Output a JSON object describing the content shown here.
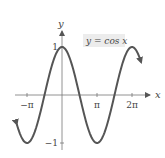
{
  "chart_data": {
    "type": "line",
    "title": "",
    "xlabel": "x",
    "ylabel": "y",
    "annotation": "y = cos x",
    "x_ticks": [
      "−π",
      "π",
      "2π"
    ],
    "y_ticks": [
      "1",
      "−1"
    ],
    "xlim": [
      -4.2,
      7.1
    ],
    "ylim": [
      -1.3,
      1.5
    ],
    "grid": false,
    "legend": "none",
    "series": [
      {
        "name": "y = cos x",
        "function": "cos(x)",
        "x_range": [
          -4.06,
          7.1
        ],
        "x": [
          -4.06,
          -3.1416,
          -1.5708,
          0,
          1.5708,
          3.1416,
          4.7124,
          6.2832,
          7.1
        ],
        "values": [
          -0.61,
          -1,
          0,
          1,
          0,
          -1,
          0,
          1,
          0.68
        ]
      }
    ],
    "color": "#555555"
  }
}
